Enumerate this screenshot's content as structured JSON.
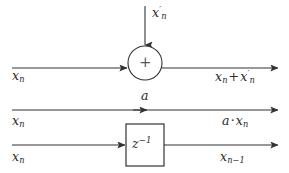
{
  "figure": {
    "background_color": "#ffffff",
    "line_color": "#333333"
  },
  "rows": {
    "adder": {
      "name": "adder-row",
      "input_left": {
        "base": "x",
        "sub": "n"
      },
      "input_top": {
        "base": "x",
        "sup": "′",
        "sub": "n"
      },
      "node_symbol": "+",
      "output": {
        "term1_base": "x",
        "term1_sub": "n",
        "operator": "+",
        "term2_base": "x",
        "term2_sup": "′",
        "term2_sub": "n"
      }
    },
    "gain": {
      "name": "gain-row",
      "input_left": {
        "base": "x",
        "sub": "n"
      },
      "gain_label": "a",
      "output": {
        "coef": "a",
        "operator": "·",
        "base": "x",
        "sub": "n"
      }
    },
    "delay": {
      "name": "delay-row",
      "input_left": {
        "base": "x",
        "sub": "n"
      },
      "block_label": {
        "base": "z",
        "sup": "−1"
      },
      "output": {
        "base": "x",
        "sub": "n−1"
      }
    }
  },
  "geometry": {
    "top_line_y": 68,
    "mid_line_y": 110,
    "bottom_line_y": 145,
    "node_center_x": 145,
    "node_radius": 17,
    "block_x": 126,
    "block_y": 124,
    "block_w": 38,
    "block_h": 42
  }
}
